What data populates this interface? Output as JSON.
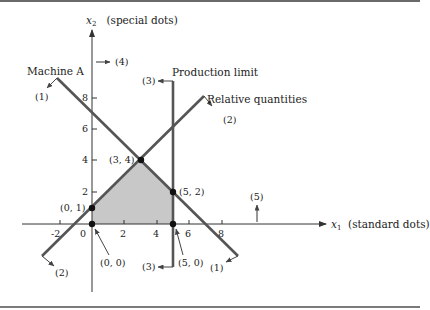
{
  "diagram": {
    "type": "linear-programming-feasible-region",
    "axes": {
      "x": {
        "symbol": "x",
        "subscript": "1",
        "label": "(standard dots)",
        "ticks": [
          "-2",
          "0",
          "2",
          "4",
          "6",
          "8"
        ]
      },
      "y": {
        "symbol": "x",
        "subscript": "2",
        "label": "(special dots)",
        "ticks": [
          "2",
          "4",
          "6",
          "8"
        ]
      }
    },
    "constraints": [
      {
        "name": "Machine A",
        "marker": "(1)",
        "equation": "x1 + x2 = 7"
      },
      {
        "name": "Relative quantities",
        "marker": "(2)",
        "equation": "x2 = x1 + 1"
      },
      {
        "name": "Production limit",
        "marker": "(3)",
        "equation": "x1 = 5"
      },
      {
        "name": "",
        "marker": "(4)",
        "equation": "x1 >= 0"
      },
      {
        "name": "",
        "marker": "(5)",
        "equation": "x2 >= 0"
      }
    ],
    "vertices": [
      {
        "label": "(0, 0)",
        "x": 0,
        "y": 0
      },
      {
        "label": "(0, 1)",
        "x": 0,
        "y": 1
      },
      {
        "label": "(3, 4)",
        "x": 3,
        "y": 4
      },
      {
        "label": "(5, 2)",
        "x": 5,
        "y": 2
      },
      {
        "label": "(5, 0)",
        "x": 5,
        "y": 0
      }
    ],
    "colors": {
      "feasible_region": "#c8c8c8",
      "lines": "#555555",
      "axes": "#333333",
      "frame": "#6a6a6a"
    }
  }
}
